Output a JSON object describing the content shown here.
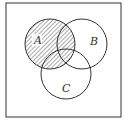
{
  "diagram": {
    "type": "venn",
    "shaded_region": "A",
    "sets": [
      {
        "name": "A",
        "label": "A"
      },
      {
        "name": "B",
        "label": "B"
      },
      {
        "name": "C",
        "label": "C"
      }
    ],
    "colors": {
      "stroke": "#333333",
      "background": "#ffffff",
      "hatch": "#555555"
    }
  }
}
